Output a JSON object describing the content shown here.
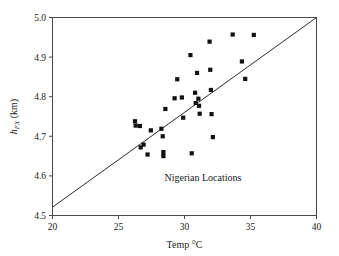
{
  "chart_data": {
    "type": "scatter",
    "title": "",
    "xlabel": "Temp °C",
    "ylabel": "h_FX (km)",
    "ylabel_parts": {
      "main": "h",
      "subscript": "FX",
      "unit": " (km)"
    },
    "xlim": [
      20,
      40
    ],
    "ylim": [
      4.5,
      5.0
    ],
    "xticks": [
      20,
      25,
      30,
      35,
      40
    ],
    "xtick_labels": [
      "20",
      "25",
      "30",
      "35",
      "40"
    ],
    "yticks": [
      4.5,
      4.6,
      4.7,
      4.8,
      4.9,
      5.0
    ],
    "ytick_labels": [
      "4.5",
      "4.6",
      "4.7",
      "4.8",
      "4.9",
      "5.0"
    ],
    "grid": false,
    "legend": null,
    "annotations": [
      {
        "text": "Nigerian Locations",
        "x": 31.4,
        "y": 4.586
      }
    ],
    "marker_style": "filled-square",
    "marker_color": "#111111",
    "points": [
      {
        "x": 26.25,
        "y": 4.738
      },
      {
        "x": 26.3,
        "y": 4.727
      },
      {
        "x": 26.62,
        "y": 4.726
      },
      {
        "x": 26.68,
        "y": 4.672
      },
      {
        "x": 26.9,
        "y": 4.679
      },
      {
        "x": 27.2,
        "y": 4.654
      },
      {
        "x": 27.45,
        "y": 4.715
      },
      {
        "x": 28.25,
        "y": 4.719
      },
      {
        "x": 28.35,
        "y": 4.7
      },
      {
        "x": 28.4,
        "y": 4.66
      },
      {
        "x": 28.4,
        "y": 4.65
      },
      {
        "x": 28.55,
        "y": 4.769
      },
      {
        "x": 29.25,
        "y": 4.796
      },
      {
        "x": 29.45,
        "y": 4.844
      },
      {
        "x": 29.8,
        "y": 4.798
      },
      {
        "x": 29.9,
        "y": 4.747
      },
      {
        "x": 30.45,
        "y": 4.905
      },
      {
        "x": 30.55,
        "y": 4.657
      },
      {
        "x": 30.8,
        "y": 4.81
      },
      {
        "x": 30.85,
        "y": 4.784
      },
      {
        "x": 30.95,
        "y": 4.86
      },
      {
        "x": 31.05,
        "y": 4.795
      },
      {
        "x": 31.1,
        "y": 4.777
      },
      {
        "x": 31.15,
        "y": 4.757
      },
      {
        "x": 31.9,
        "y": 4.939
      },
      {
        "x": 31.95,
        "y": 4.868
      },
      {
        "x": 32.0,
        "y": 4.817
      },
      {
        "x": 32.05,
        "y": 4.756
      },
      {
        "x": 32.15,
        "y": 4.698
      },
      {
        "x": 33.65,
        "y": 4.957
      },
      {
        "x": 34.35,
        "y": 4.889
      },
      {
        "x": 34.6,
        "y": 4.845
      },
      {
        "x": 35.25,
        "y": 4.956
      }
    ],
    "fit_line": {
      "label": "reference-line",
      "x0": 20.0,
      "y0": 4.521,
      "x1": 40.0,
      "y1": 5.0
    }
  }
}
